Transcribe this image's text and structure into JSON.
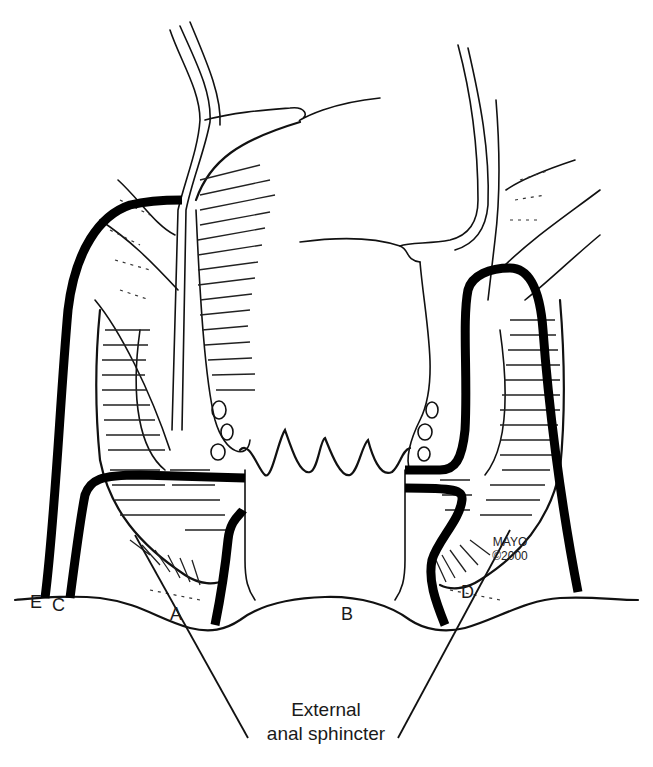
{
  "figure": {
    "type": "anatomical illustration",
    "colors": {
      "ink": "#111111",
      "background": "#ffffff",
      "tract": "#000000"
    }
  },
  "labels": {
    "A": "A",
    "B": "B",
    "C": "C",
    "D": "D",
    "E": "E"
  },
  "credit": {
    "line1": "MAYO",
    "line2": "©2000"
  },
  "caption": {
    "line1": "External",
    "line2": "anal sphincter"
  }
}
